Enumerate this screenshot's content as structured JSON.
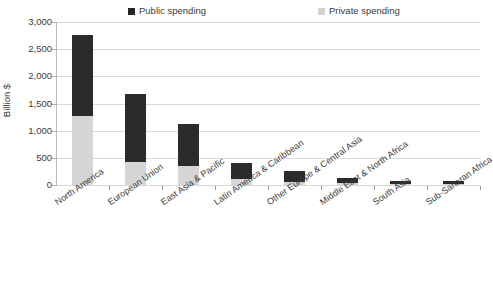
{
  "chart_data": {
    "type": "bar",
    "subtype": "stacked-vertical",
    "title": "",
    "xlabel": "",
    "ylabel": "Billion $",
    "ylim": [
      0,
      3000
    ],
    "ytick_step": 500,
    "ytick_labels": [
      "3,000",
      "2,500",
      "2,000",
      "1,500",
      "1,000",
      "500",
      "0"
    ],
    "ytick_values": [
      3000,
      2500,
      2000,
      1500,
      1000,
      500,
      0
    ],
    "grid": true,
    "legend_position": "top-center",
    "categories": [
      "North America",
      "European Union",
      "East Asia & Pacific",
      "Latin America & Caribbean",
      "Other Europe & Central Asia",
      "Middle East & North Africa",
      "South Asia",
      "Sub-Saharan Africa"
    ],
    "series": [
      {
        "name": "Private spending",
        "color": "#d6d6d6",
        "values": [
          1270,
          430,
          350,
          110,
          55,
          30,
          15,
          15
        ]
      },
      {
        "name": "Public spending",
        "color": "#2b2b2b",
        "values": [
          1490,
          1250,
          770,
          290,
          205,
          100,
          55,
          55
        ]
      }
    ],
    "totals": [
      2760,
      1680,
      1120,
      400,
      260,
      130,
      70,
      70
    ]
  },
  "legend": {
    "entries": [
      {
        "label": "Public spending",
        "color": "#262626"
      },
      {
        "label": "Private spending",
        "color": "#d3d3d3"
      }
    ]
  },
  "axis": {
    "y_title": "Billion $"
  }
}
